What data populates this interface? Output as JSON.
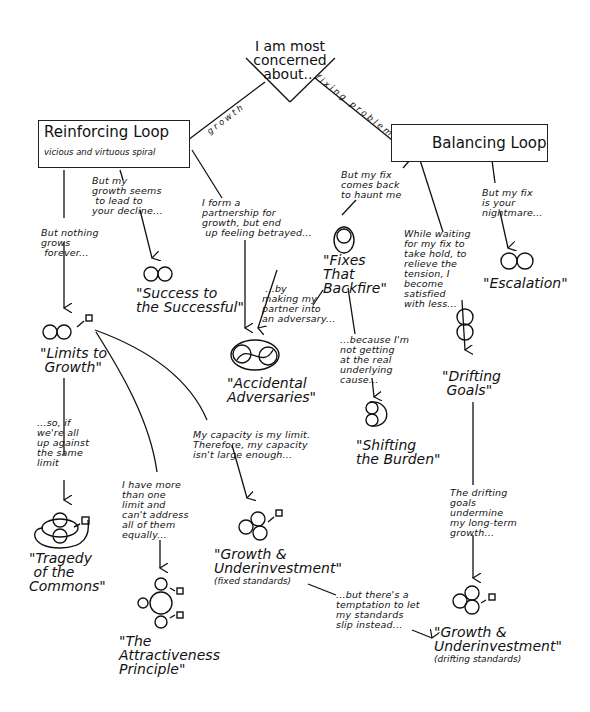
{
  "root": {
    "text": "I am most\nconcerned\nabout..."
  },
  "branches": {
    "left": "growth",
    "right": "fixing problems"
  },
  "reinforcing": {
    "title": "Reinforcing Loop",
    "subtitle": "vicious and virtuous spiral"
  },
  "balancing": {
    "title": "Balancing Loop"
  },
  "notes": {
    "growth_decline": "But my\ngrowth seems\n to lead to\nyour decline...",
    "partnership": "I form a\npartnership for\ngrowth, but end\n up feeling betrayed...",
    "nothing_grows": "But nothing\ngrows\n forever...",
    "by_making": " ...by\nmaking my\npartner into\nan adversary...",
    "fix_haunt": "But my fix\ncomes back\nto haunt me",
    "while_waiting": "While waiting\nfor my fix to\ntake hold, to\nrelieve the\ntension, I\nbecome\nsatisfied\nwith less...",
    "fix_nightmare": "But my fix\nis your\nnightmare...",
    "not_getting": "...because I'm\nnot getting\nat the real\nunderlying\ncause...",
    "so_if": "...so, if\nwe're all\nup against\nthe same\nlimit",
    "more_than_one": "I have more\nthan one\nlimit and\ncan't address\nall of them\nequally...",
    "capacity": "My capacity is my limit.\nTherefore, my capacity\nisn't large enough...",
    "drifting_undermine": "The drifting\ngoals\nundermine\nmy long-term\ngrowth...",
    "temptation": "...but there's a\ntemptation to let\nmy standards\nslip instead..."
  },
  "archetypes": {
    "success": "\"Success to\nthe Successful\"",
    "limits": "\"Limits to\n Growth\"",
    "adversaries": "\"Accidental\nAdversaries\"",
    "fixes": "\"Fixes\nThat\nBackfire\"",
    "escalation": "\"Escalation\"",
    "shifting": "\"Shifting\nthe Burden\"",
    "drifting": "\"Drifting\n Goals\"",
    "tragedy": "\"Tragedy\n of the\nCommons\"",
    "growth_fixed": {
      "title": "\"Growth &\nUnderinvestment\"",
      "sub": "(fixed standards)"
    },
    "attractiveness": "\"The\nAttractiveness\nPrinciple\"",
    "growth_drifting": {
      "title": "\"Growth &\nUnderinvestment\"",
      "sub": "(drifting standards)"
    }
  }
}
